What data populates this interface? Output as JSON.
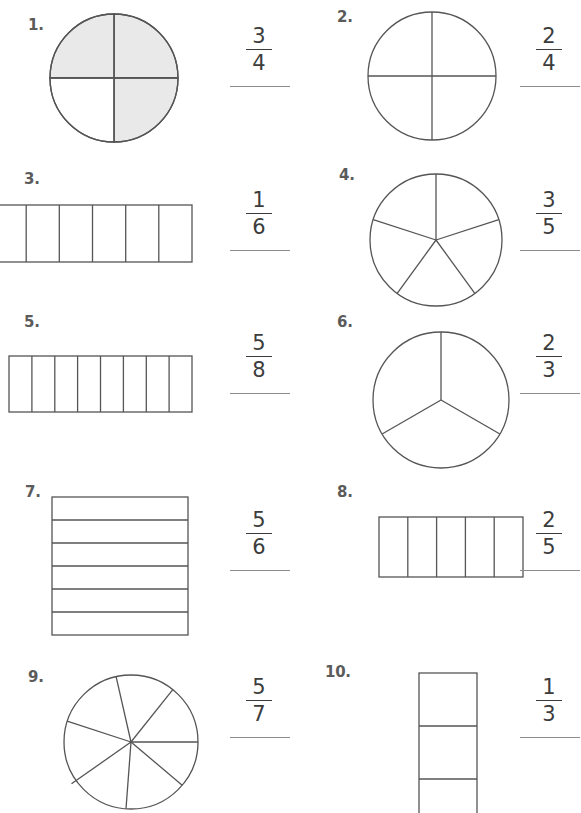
{
  "page": {
    "background_color": "#ffffff",
    "shape_stroke_color": "#555555",
    "shaded_fill_color": "#e9e9e9",
    "text_color": "#4a4a4a",
    "answer_line_color": "#8c8c8c"
  },
  "problems": [
    {
      "number": "1.",
      "shape": "circle",
      "parts": 4,
      "shaded_parts": 3,
      "numerator": "3",
      "denominator": "4"
    },
    {
      "number": "2.",
      "shape": "circle",
      "parts": 4,
      "shaded_parts": 0,
      "numerator": "2",
      "denominator": "4"
    },
    {
      "number": "3.",
      "shape": "bar-horizontal",
      "parts": 6,
      "shaded_parts": 0,
      "numerator": "1",
      "denominator": "6"
    },
    {
      "number": "4.",
      "shape": "circle",
      "parts": 5,
      "shaded_parts": 0,
      "numerator": "3",
      "denominator": "5"
    },
    {
      "number": "5.",
      "shape": "bar-horizontal",
      "parts": 8,
      "shaded_parts": 0,
      "numerator": "5",
      "denominator": "8"
    },
    {
      "number": "6.",
      "shape": "circle",
      "parts": 3,
      "shaded_parts": 0,
      "numerator": "2",
      "denominator": "3"
    },
    {
      "number": "7.",
      "shape": "square-rows",
      "parts": 6,
      "shaded_parts": 0,
      "numerator": "5",
      "denominator": "6"
    },
    {
      "number": "8.",
      "shape": "bar-horizontal",
      "parts": 5,
      "shaded_parts": 0,
      "numerator": "2",
      "denominator": "5"
    },
    {
      "number": "9.",
      "shape": "circle",
      "parts": 7,
      "shaded_parts": 0,
      "numerator": "5",
      "denominator": "7"
    },
    {
      "number": "10.",
      "shape": "bar-vertical",
      "parts": 3,
      "shaded_parts": 0,
      "numerator": "1",
      "denominator": "3"
    }
  ]
}
